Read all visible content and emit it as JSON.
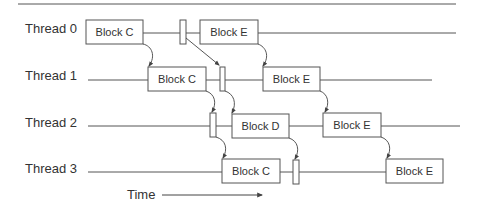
{
  "diagram": {
    "colors": {
      "line": "#555555",
      "box_fill": "#ffffff",
      "text": "#333333"
    },
    "threads": [
      {
        "label": "Thread 0",
        "blocks": [
          {
            "label": "Block C"
          },
          {
            "label": "Block E"
          }
        ]
      },
      {
        "label": "Thread 1",
        "blocks": [
          {
            "label": "Block C"
          },
          {
            "label": "Block E"
          }
        ]
      },
      {
        "label": "Thread 2",
        "blocks": [
          {
            "label": "Block D"
          },
          {
            "label": "Block E"
          }
        ]
      },
      {
        "label": "Thread 3",
        "blocks": [
          {
            "label": "Block C"
          },
          {
            "label": "Block E"
          }
        ]
      }
    ],
    "time_axis": {
      "label": "Time"
    }
  }
}
